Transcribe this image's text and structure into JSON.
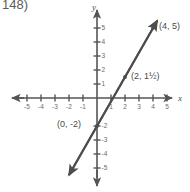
{
  "problem": {
    "number_label": "148)"
  },
  "chart_data": {
    "type": "line",
    "title": "",
    "xlabel": "x",
    "ylabel": "y",
    "xlim": [
      -5.8,
      5.8
    ],
    "ylim": [
      -5.8,
      5.8
    ],
    "grid": false,
    "legend": "none",
    "x_tick_labels": [
      "-5",
      "-4",
      "-3",
      "-2",
      "-1",
      "1",
      "2",
      "3",
      "4",
      "5"
    ],
    "x_tick_values": [
      -5,
      -4,
      -3,
      -2,
      -1,
      1,
      2,
      3,
      4,
      5
    ],
    "y_tick_labels": [
      "5",
      "4",
      "3",
      "2",
      "1",
      "-2",
      "-3",
      "-4",
      "-5"
    ],
    "y_tick_values": [
      5,
      4,
      3,
      2,
      1,
      -2,
      -3,
      -4,
      -5
    ],
    "series": [
      {
        "name": "line",
        "equation": "y = 1.75x - 2",
        "slope": 1.75,
        "intercept": -2,
        "x": [
          -2.0,
          4.3
        ],
        "values": [
          -5.5,
          5.525
        ],
        "arrows": "both"
      }
    ],
    "annotations": [
      {
        "label": "(4, 5)",
        "x": 4,
        "y": 5,
        "dot": true,
        "label_dx": 6,
        "label_dy": 1
      },
      {
        "label": "(2, 1½)",
        "x": 2,
        "y": 1.5,
        "dot": true,
        "label_dx": 6,
        "label_dy": 2
      },
      {
        "label": "(0, -2)",
        "x": 0,
        "y": -2,
        "dot": true,
        "label_dx": -40,
        "label_dy": 1
      }
    ]
  },
  "axis_names": {
    "x_axis_letter": "x",
    "y_axis_letter": "y"
  },
  "colors": {
    "axis": "#555555",
    "line": "#4d4d4d",
    "text": "#4a4a4a",
    "tick_text": "#6a6a6a",
    "background": "#ffffff"
  }
}
